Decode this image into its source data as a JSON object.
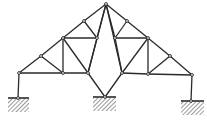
{
  "diagram": {
    "type": "truss",
    "colors": {
      "member": "#2a2a2a",
      "node_fill": "#ffffff",
      "node_stroke": "#222222",
      "hatch": "#555555",
      "background": "#ffffff"
    },
    "nodes": [
      {
        "id": "A",
        "x": 106,
        "y": 4
      },
      {
        "id": "L1",
        "x": 84,
        "y": 21
      },
      {
        "id": "L2",
        "x": 63,
        "y": 38
      },
      {
        "id": "L3",
        "x": 41,
        "y": 56
      },
      {
        "id": "L4",
        "x": 19,
        "y": 73
      },
      {
        "id": "R1",
        "x": 127,
        "y": 21
      },
      {
        "id": "R2",
        "x": 148,
        "y": 38
      },
      {
        "id": "R3",
        "x": 170,
        "y": 56
      },
      {
        "id": "R4",
        "x": 192,
        "y": 75
      },
      {
        "id": "IL",
        "x": 97,
        "y": 38
      },
      {
        "id": "IR",
        "x": 115,
        "y": 38
      },
      {
        "id": "BL1",
        "x": 63,
        "y": 73
      },
      {
        "id": "BL2",
        "x": 88,
        "y": 73
      },
      {
        "id": "BR1",
        "x": 122,
        "y": 73
      },
      {
        "id": "BR2",
        "x": 148,
        "y": 74
      },
      {
        "id": "C",
        "x": 105,
        "y": 97
      },
      {
        "id": "SL",
        "x": 18,
        "y": 98
      },
      {
        "id": "SR",
        "x": 191,
        "y": 101
      }
    ],
    "members": [
      [
        "A",
        "L1"
      ],
      [
        "L1",
        "L2"
      ],
      [
        "L2",
        "L3"
      ],
      [
        "L3",
        "L4"
      ],
      [
        "A",
        "R1"
      ],
      [
        "R1",
        "R2"
      ],
      [
        "R2",
        "R3"
      ],
      [
        "R3",
        "R4"
      ],
      [
        "L4",
        "BL1"
      ],
      [
        "BL1",
        "BL2"
      ],
      [
        "BR1",
        "BR2"
      ],
      [
        "BR2",
        "R4"
      ],
      [
        "L4",
        "SL"
      ],
      [
        "R4",
        "SR"
      ],
      [
        "L3",
        "BL1"
      ],
      [
        "L2",
        "BL1"
      ],
      [
        "L2",
        "BL2"
      ],
      [
        "L2",
        "IL"
      ],
      [
        "L1",
        "IL"
      ],
      [
        "IL",
        "BL2"
      ],
      [
        "A",
        "IL"
      ],
      [
        "A",
        "IR"
      ],
      [
        "R1",
        "IR"
      ],
      [
        "R2",
        "IR"
      ],
      [
        "IR",
        "BR1"
      ],
      [
        "R2",
        "BR1"
      ],
      [
        "R2",
        "BR2"
      ],
      [
        "R3",
        "BR2"
      ],
      [
        "A",
        "BL2"
      ],
      [
        "A",
        "BR1"
      ],
      [
        "BL2",
        "C"
      ],
      [
        "BR1",
        "C"
      ]
    ],
    "supports": [
      {
        "id": "support-left",
        "x1": 8,
        "x2": 29,
        "y": 98,
        "hatch_h": 13
      },
      {
        "id": "support-center",
        "x1": 93,
        "x2": 116,
        "y": 97,
        "hatch_h": 13
      },
      {
        "id": "support-right",
        "x1": 181,
        "x2": 204,
        "y": 101,
        "hatch_h": 13
      }
    ]
  }
}
